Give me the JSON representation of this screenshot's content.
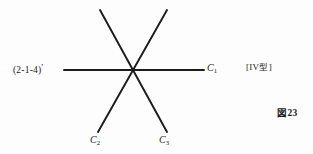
{
  "figure": {
    "caption": "図 23",
    "caption_prefix": "図",
    "caption_number": "23",
    "type_note": "[IV 型]",
    "type_note_open": "[",
    "type_note_roman": "IV",
    "type_note_kanji": "型",
    "type_note_close": "]",
    "background_color": "#fdfdfd",
    "ink_color": "#1b1b1b"
  },
  "labels": {
    "direction_index": "(2-1-4)'",
    "direction_index_body": "(2-1-4)",
    "direction_index_prime": "′",
    "c1": "C",
    "c1_sub": "1",
    "c2": "C",
    "c2_sub": "2",
    "c3": "C",
    "c3_sub": "3"
  },
  "chart_data": {
    "type": "line",
    "xlabel": "",
    "ylabel": "",
    "xlim": [
      0,
      313
    ],
    "ylim": [
      0,
      154
    ],
    "grid": false,
    "legend_position": "none",
    "intersection": {
      "x": 132,
      "y": 70
    },
    "series": [
      {
        "name": "C1",
        "stroke": "#1b1b1b",
        "width": 1.9,
        "x": [
          64,
          204
        ],
        "y": [
          70,
          70
        ],
        "end_label": "C1"
      },
      {
        "name": "C3",
        "stroke": "#1b1b1b",
        "width": 1.9,
        "x": [
          100,
          167
        ],
        "y": [
          10,
          132
        ],
        "end_label": "C3"
      },
      {
        "name": "C2",
        "stroke": "#1b1b1b",
        "width": 1.9,
        "x": [
          167,
          98
        ],
        "y": [
          10,
          132
        ],
        "end_label": "C2"
      }
    ],
    "annotations": [
      {
        "text": "(2-1-4)'",
        "x": 13,
        "y": 70,
        "anchor": "left-of-horizontal-line"
      },
      {
        "text": "C1",
        "x": 207,
        "y": 70,
        "anchor": "right-end"
      },
      {
        "text": "C2",
        "x": 90,
        "y": 140,
        "anchor": "lower-left-end"
      },
      {
        "text": "C3",
        "x": 159,
        "y": 140,
        "anchor": "lower-right-end"
      },
      {
        "text": "[IV 型]",
        "x": 246,
        "y": 70,
        "anchor": "right-margin"
      },
      {
        "text": "図 23",
        "x": 277,
        "y": 113,
        "anchor": "bottom-right"
      }
    ]
  }
}
